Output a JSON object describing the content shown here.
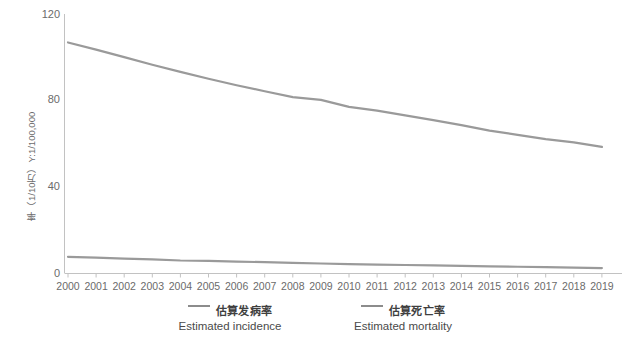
{
  "chart_data": {
    "type": "line",
    "title": "",
    "xlabel": "",
    "ylabel": "率（1/10万）Y:1/100,000",
    "ylim": [
      0,
      120
    ],
    "yticks": [
      0,
      40,
      80,
      120
    ],
    "grid": false,
    "legend_position": "bottom",
    "categories": [
      "2000",
      "2001",
      "2002",
      "2003",
      "2004",
      "2005",
      "2006",
      "2007",
      "2008",
      "2009",
      "2010",
      "2011",
      "2012",
      "2013",
      "2014",
      "2015",
      "2016",
      "2017",
      "2018",
      "2019"
    ],
    "series": [
      {
        "name": "估算发病率",
        "name_en": "Estimated incidence",
        "color": "#9a9a9a",
        "values": [
          106.8,
          103.5,
          100.0,
          96.5,
          93.2,
          90.0,
          87.0,
          84.2,
          81.5,
          80.2,
          77.0,
          75.2,
          73.0,
          70.8,
          68.5,
          66.0,
          64.0,
          62.0,
          60.5,
          58.4
        ]
      },
      {
        "name": "估算死亡率",
        "name_en": "Estimated mortality",
        "color": "#9a9a9a",
        "values": [
          7.5,
          7.1,
          6.7,
          6.3,
          5.8,
          5.6,
          5.3,
          5.0,
          4.7,
          4.4,
          4.1,
          3.9,
          3.7,
          3.5,
          3.3,
          3.1,
          2.9,
          2.7,
          2.5,
          2.3
        ]
      }
    ]
  },
  "axis": {
    "y_label_text": "率（1/10万）Y:1/100,000",
    "y_tick_labels": [
      "120",
      "80",
      "40",
      "0"
    ],
    "x_tick_labels": [
      "2000",
      "2001",
      "2002",
      "2003",
      "2004",
      "2005",
      "2006",
      "2007",
      "2008",
      "2009",
      "2010",
      "2011",
      "2012",
      "2013",
      "2014",
      "2015",
      "2016",
      "2017",
      "2018",
      "2019"
    ]
  },
  "legend": {
    "items": [
      {
        "label_cn": "估算发病率",
        "label_en": "Estimated incidence"
      },
      {
        "label_cn": "估算死亡率",
        "label_en": "Estimated mortality"
      }
    ]
  },
  "colors": {
    "line": "#9a9a9a",
    "axis": "#bfbfbf",
    "text": "#6b6b6b"
  }
}
